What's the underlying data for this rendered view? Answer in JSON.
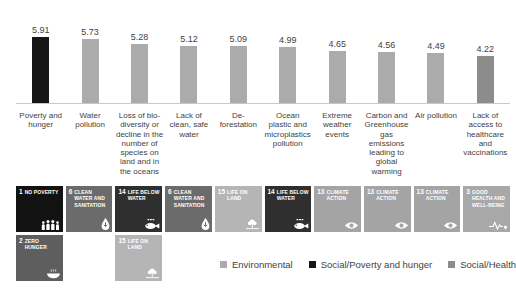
{
  "chart_data": {
    "type": "bar",
    "title": "",
    "xlabel": "",
    "ylabel": "",
    "ylim": [
      0,
      6.5
    ],
    "grid": false,
    "legend_position": "bottom-right",
    "categories": [
      "Poverty and hunger",
      "Water pollution",
      "Loss of bio-diversity or decline in the number of species on land and in the oceans",
      "Lack of clean, safe water",
      "De-forestation",
      "Ocean plastic and microplastics pollution",
      "Extreme weather events",
      "Carbon and Greenhouse gas emissions leading to global warming",
      "Air pollution",
      "Lack of access to healthcare and vaccinations"
    ],
    "values": [
      5.91,
      5.73,
      5.28,
      5.12,
      5.09,
      4.99,
      4.65,
      4.56,
      4.49,
      4.22
    ],
    "bar_colors": [
      "#161616",
      "#ababab",
      "#ababab",
      "#ababab",
      "#ababab",
      "#ababab",
      "#ababab",
      "#ababab",
      "#ababab",
      "#8c8c8c"
    ],
    "bar_groups": [
      "Social/Poverty and hunger",
      "Environmental",
      "Environmental",
      "Environmental",
      "Environmental",
      "Environmental",
      "Environmental",
      "Environmental",
      "Environmental",
      "Social/Health"
    ]
  },
  "legend": {
    "items": [
      {
        "label": "Environmental",
        "color": "#ababab"
      },
      {
        "label": "Social/Poverty and hunger",
        "color": "#161616"
      },
      {
        "label": "Social/Health",
        "color": "#8c8c8c"
      }
    ]
  },
  "sdg_badges": {
    "row1": [
      {
        "num": "1",
        "title": "NO POVERTY",
        "icon": "people-icon",
        "bg": "#121212"
      },
      {
        "num": "6",
        "title": "CLEAN WATER AND SANITATION",
        "icon": "water-drop-icon",
        "bg": "#6b6b6b"
      },
      {
        "num": "14",
        "title": "LIFE BELOW WATER",
        "icon": "fish-icon",
        "bg": "#2f2f2f"
      },
      {
        "num": "6",
        "title": "CLEAN WATER AND SANITATION",
        "icon": "water-drop-icon",
        "bg": "#6b6b6b"
      },
      {
        "num": "15",
        "title": "LIFE ON LAND",
        "icon": "tree-icon",
        "bg": "#b5b5b5"
      },
      {
        "num": "14",
        "title": "LIFE BELOW WATER",
        "icon": "fish-icon",
        "bg": "#2f2f2f"
      },
      {
        "num": "13",
        "title": "CLIMATE ACTION",
        "icon": "eye-globe-icon",
        "bg": "#a4a4a4"
      },
      {
        "num": "13",
        "title": "CLIMATE ACTION",
        "icon": "eye-globe-icon",
        "bg": "#a4a4a4"
      },
      {
        "num": "13",
        "title": "CLIMATE ACTION",
        "icon": "eye-globe-icon",
        "bg": "#a4a4a4"
      },
      {
        "num": "3",
        "title": "GOOD HEALTH AND WELL-BEING",
        "icon": "heartbeat-icon",
        "bg": "#a8a8a8"
      }
    ],
    "row2": [
      {
        "num": "2",
        "title": "ZERO HUNGER",
        "icon": "bowl-icon",
        "bg": "#5e5e5e"
      },
      {
        "num": "15",
        "title": "LIFE ON LAND",
        "icon": "tree-icon",
        "bg": "#b5b5b5"
      }
    ]
  }
}
